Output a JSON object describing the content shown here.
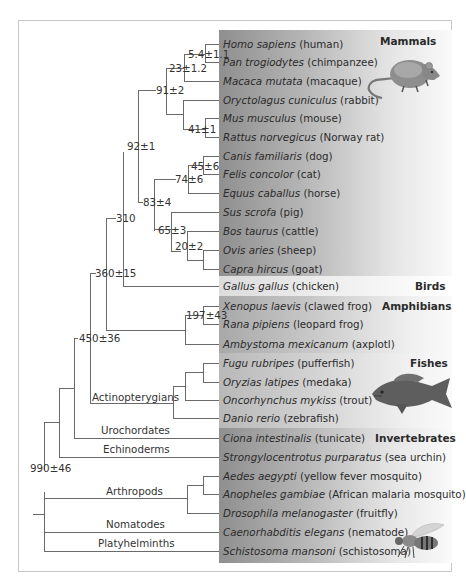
{
  "groups": {
    "mammals": "Mammals",
    "birds": "Birds",
    "amphibians": "Amphibians",
    "fishes": "Fishes",
    "invertebrates": "Invertebrates"
  },
  "taxa": [
    {
      "sci": "Homo sapiens",
      "common": "(human)"
    },
    {
      "sci": "Pan trogiodytes",
      "common": "(chimpanzee)"
    },
    {
      "sci": "Macaca mutata",
      "common": "(macaque)"
    },
    {
      "sci": "Oryctolagus cuniculus",
      "common": "(rabbit)"
    },
    {
      "sci": "Mus musculus",
      "common": "(mouse)"
    },
    {
      "sci": "Rattus norvegicus",
      "common": "(Norway rat)"
    },
    {
      "sci": "Canis familiaris",
      "common": "(dog)"
    },
    {
      "sci": "Felis concolor",
      "common": "(cat)"
    },
    {
      "sci": "Equus caballus",
      "common": "(horse)"
    },
    {
      "sci": "Sus scrofa",
      "common": "(pig)"
    },
    {
      "sci": "Bos taurus",
      "common": "(cattle)"
    },
    {
      "sci": "Ovis aries",
      "common": "(sheep)"
    },
    {
      "sci": "Capra hircus",
      "common": "(goat)"
    },
    {
      "sci": "Gallus gallus",
      "common": "(chicken)"
    },
    {
      "sci": "Xenopus laevis",
      "common": "(clawed frog)"
    },
    {
      "sci": "Rana pipiens",
      "common": "(leopard frog)"
    },
    {
      "sci": "Ambystoma mexicanum",
      "common": "(axplotl)"
    },
    {
      "sci": "Fugu rubripes",
      "common": "(pufferfish)"
    },
    {
      "sci": "Oryzias latipes",
      "common": "(medaka)"
    },
    {
      "sci": "Oncorhynchus mykiss",
      "common": "(trout)"
    },
    {
      "sci": "Danio rerio",
      "common": "(zebrafish)"
    },
    {
      "sci": "Ciona intestinalis",
      "common": "(tunicate)"
    },
    {
      "sci": "Strongylocentrotus purparatus",
      "common": "(sea urchin)"
    },
    {
      "sci": "Aedes aegypti",
      "common": "(yellow fever mosquito)"
    },
    {
      "sci": "Anopheles gambiae",
      "common": "(African malaria mosquito)"
    },
    {
      "sci": "Drosophila melanogaster",
      "common": "(fruitfly)"
    },
    {
      "sci": "Caenorhabditis elegans",
      "common": "(nematode)"
    },
    {
      "sci": "Schistosoma mansoni",
      "common": "(schistosoma)"
    }
  ],
  "nodes": {
    "n_5_4": "5.4±1.1",
    "n_23": "23±1.2",
    "n_91": "91±2",
    "n_41": "41±1",
    "n_92": "92±1",
    "n_45": "45±6",
    "n_74": "74±6",
    "n_83": "83±4",
    "n_65": "65±3",
    "n_20": "20±2",
    "n_310": "310",
    "n_360": "360±15",
    "n_197": "197±43",
    "n_450": "450±36",
    "n_990": "990±46"
  },
  "clades": {
    "actinopterygians": "Actinopterygians",
    "urochordates": "Urochordates",
    "echinoderms": "Echinoderms",
    "arthropods": "Arthropods",
    "nomatodes": "Nomatodes",
    "platyhelminths": "Platyhelminths"
  },
  "icons": {
    "mammal": "mouse-illustration",
    "fish": "fish-illustration",
    "insect": "bee-illustration"
  }
}
